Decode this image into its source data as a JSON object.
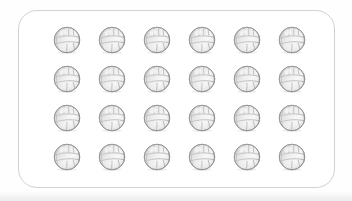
{
  "canvas": {
    "width": 352,
    "height": 201,
    "background_color": "#fefefe",
    "bottom_wash_color": "#efefef"
  },
  "card": {
    "name": "rounded-panel",
    "x": 18,
    "y": 10,
    "width": 317,
    "height": 178,
    "corner_radius": 19,
    "border_color": "#d2d2d2",
    "border_width": 1.4,
    "fill_color": "#ffffff"
  },
  "grid": {
    "item_label": "volleyball",
    "rows": 4,
    "columns": 6,
    "total_count": 24,
    "ball_diameter": 30,
    "column_pitch": 45,
    "row_pitch": 39,
    "first_ball_x": 33,
    "first_ball_y": 14
  },
  "ball_style": {
    "outline_color": "#8c8c8c",
    "seam_color": "#9a9a9a",
    "fill_light": "#ffffff",
    "fill_shade": "#e3e3e3",
    "shadow_color": "#cfcfcf",
    "highlight_color": "#fbfbfb"
  },
  "items": [
    {
      "index": 1,
      "row": 1,
      "col": 1,
      "name": "volleyball"
    },
    {
      "index": 2,
      "row": 1,
      "col": 2,
      "name": "volleyball"
    },
    {
      "index": 3,
      "row": 1,
      "col": 3,
      "name": "volleyball"
    },
    {
      "index": 4,
      "row": 1,
      "col": 4,
      "name": "volleyball"
    },
    {
      "index": 5,
      "row": 1,
      "col": 5,
      "name": "volleyball"
    },
    {
      "index": 6,
      "row": 1,
      "col": 6,
      "name": "volleyball"
    },
    {
      "index": 7,
      "row": 2,
      "col": 1,
      "name": "volleyball"
    },
    {
      "index": 8,
      "row": 2,
      "col": 2,
      "name": "volleyball"
    },
    {
      "index": 9,
      "row": 2,
      "col": 3,
      "name": "volleyball"
    },
    {
      "index": 10,
      "row": 2,
      "col": 4,
      "name": "volleyball"
    },
    {
      "index": 11,
      "row": 2,
      "col": 5,
      "name": "volleyball"
    },
    {
      "index": 12,
      "row": 2,
      "col": 6,
      "name": "volleyball"
    },
    {
      "index": 13,
      "row": 3,
      "col": 1,
      "name": "volleyball"
    },
    {
      "index": 14,
      "row": 3,
      "col": 2,
      "name": "volleyball"
    },
    {
      "index": 15,
      "row": 3,
      "col": 3,
      "name": "volleyball"
    },
    {
      "index": 16,
      "row": 3,
      "col": 4,
      "name": "volleyball"
    },
    {
      "index": 17,
      "row": 3,
      "col": 5,
      "name": "volleyball"
    },
    {
      "index": 18,
      "row": 3,
      "col": 6,
      "name": "volleyball"
    },
    {
      "index": 19,
      "row": 4,
      "col": 1,
      "name": "volleyball"
    },
    {
      "index": 20,
      "row": 4,
      "col": 2,
      "name": "volleyball"
    },
    {
      "index": 21,
      "row": 4,
      "col": 3,
      "name": "volleyball"
    },
    {
      "index": 22,
      "row": 4,
      "col": 4,
      "name": "volleyball"
    },
    {
      "index": 23,
      "row": 4,
      "col": 5,
      "name": "volleyball"
    },
    {
      "index": 24,
      "row": 4,
      "col": 6,
      "name": "volleyball"
    }
  ]
}
